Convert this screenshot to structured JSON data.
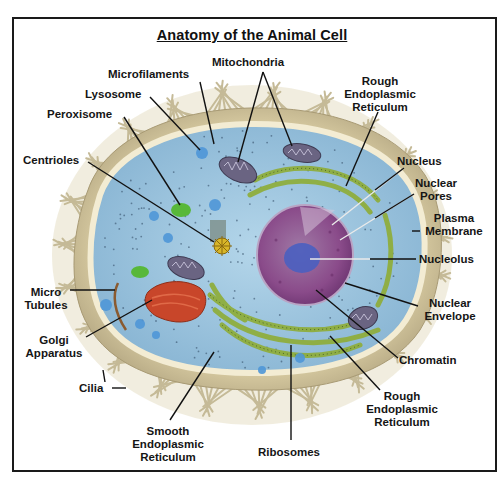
{
  "title": "Anatomy of the Animal Cell",
  "labels": {
    "mitochondria": "Mitochondria",
    "microfilaments": "Microfilaments",
    "lysosome": "Lysosome",
    "peroxisome": "Peroxisome",
    "centrioles": "Centrioles",
    "rough_er_top": [
      "Rough",
      "Endoplasmic",
      "Reticulum"
    ],
    "nucleus": "Nucleus",
    "nuclear_pores": [
      "Nuclear",
      "Pores"
    ],
    "plasma_membrane": [
      "Plasma",
      "Membrane"
    ],
    "nucleolus": "Nucleolus",
    "nuclear_envelope": [
      "Nuclear",
      "Envelope"
    ],
    "chromatin": "Chromatin",
    "rough_er_bottom": [
      "Rough",
      "Endoplasmic",
      "Reticulum"
    ],
    "micro_tubules": [
      "Micro",
      "Tubules"
    ],
    "golgi_apparatus": [
      "Golgi",
      "Apparatus"
    ],
    "cilia": "Cilia",
    "smooth_er": [
      "Smooth",
      "Endoplasmic",
      "Reticulum"
    ],
    "ribosomes": "Ribosomes"
  },
  "colors": {
    "cytoplasm": "#9cc3dc",
    "membrane": "#efe6c8",
    "cilia": "#d8cfa8",
    "nucleus": "#8e4f8c",
    "nucleolus": "#4a5fc0",
    "golgi": "#c8462a",
    "er": "#9cb84a",
    "mitochondria": "#6a6482",
    "peroxisome": "#58b83a",
    "lysosome": "#4f97d8",
    "leader_line": "#111111"
  }
}
